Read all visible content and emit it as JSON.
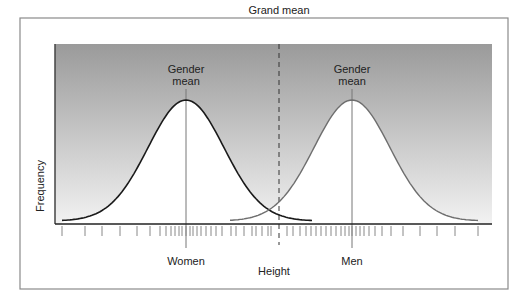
{
  "figure": {
    "grand_mean_label": "Grand mean",
    "women_mean_label_line1": "Gender",
    "women_mean_label_line2": "mean",
    "men_mean_label_line1": "Gender",
    "men_mean_label_line2": "mean",
    "y_axis_label": "Frequency",
    "x_axis_label": "Height",
    "women_label": "Women",
    "men_label": "Men",
    "colors": {
      "gradient_top": "#9a9a9a",
      "gradient_bottom": "#f2f2f2",
      "women_curve": "#1a1a1a",
      "men_curve": "#6e6e6e",
      "frame": "#8a8a8a",
      "axis": "#222222"
    }
  },
  "chart_data": {
    "type": "line",
    "title": "",
    "xlabel": "Height",
    "ylabel": "Frequency",
    "series": [
      {
        "name": "Women",
        "distribution": "normal",
        "mean_position": 186,
        "peak_relative": 1.0,
        "color": "#1a1a1a"
      },
      {
        "name": "Men",
        "distribution": "normal",
        "mean_position": 352,
        "peak_relative": 1.0,
        "color": "#6e6e6e"
      }
    ],
    "annotations": [
      {
        "text": "Grand mean",
        "type": "dashed-vertical-line",
        "x_position": 279
      },
      {
        "text": "Gender mean",
        "type": "vertical-line",
        "series": "Women"
      },
      {
        "text": "Gender mean",
        "type": "vertical-line",
        "series": "Men"
      }
    ],
    "tick_positions": [
      62,
      85,
      102,
      120,
      137,
      150,
      160,
      166,
      171,
      175,
      179,
      182,
      186,
      190,
      193,
      197,
      201,
      206,
      211,
      216,
      222,
      231,
      236,
      244,
      252,
      256,
      262,
      268,
      271,
      287,
      293,
      300,
      306,
      311,
      316,
      321,
      326,
      331,
      336,
      341,
      345,
      349,
      352,
      356,
      360,
      364,
      369,
      375,
      382,
      391,
      403,
      420,
      437,
      455,
      478
    ],
    "grid": false,
    "legend": "none"
  }
}
